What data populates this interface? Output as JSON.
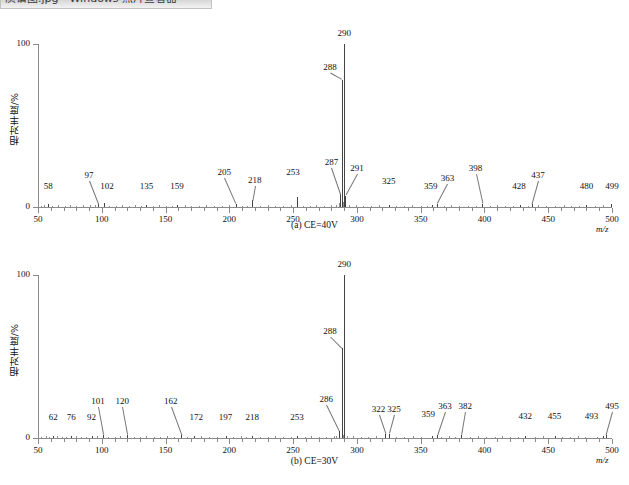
{
  "title_bar": {
    "text": "质谱图.jpg - Windows 照片查看器"
  },
  "figure": {
    "y_axis_title": "相对丰度/%",
    "x_axis_title": "m/z",
    "y_ticks": [
      0,
      100
    ],
    "y_tick_labels": [
      "0",
      "100"
    ],
    "x_range": [
      50,
      500
    ],
    "x_major_ticks": [
      50,
      100,
      150,
      200,
      250,
      300,
      350,
      400,
      450,
      500
    ],
    "x_major_labels": [
      "50",
      "100",
      "150",
      "200",
      "250",
      "300",
      "350",
      "400",
      "450",
      "500"
    ],
    "x_minor_step": 10
  },
  "captions": {
    "a": "(a) CE=40V",
    "b": "(b) CE=30V"
  },
  "chart_data": [
    {
      "type": "bar",
      "title": "(a) CE=40V",
      "xlabel": "m/z",
      "ylabel": "相对丰度/%",
      "xlim": [
        50,
        500
      ],
      "ylim": [
        0,
        100
      ],
      "grid": false,
      "legend": "none",
      "labeled_peaks": [
        {
          "mz": 58,
          "intensity": 2.0,
          "label": "58",
          "label_x": 58,
          "label_y": 9,
          "leader": false
        },
        {
          "mz": 97,
          "intensity": 2.0,
          "label": "97",
          "label_x": 90,
          "label_y": 16,
          "leader": true
        },
        {
          "mz": 102,
          "intensity": 2.5,
          "label": "102",
          "label_x": 104,
          "label_y": 9,
          "leader": false
        },
        {
          "mz": 135,
          "intensity": 1.5,
          "label": "135",
          "label_x": 135,
          "label_y": 9,
          "leader": false
        },
        {
          "mz": 159,
          "intensity": 1.5,
          "label": "159",
          "label_x": 159,
          "label_y": 9,
          "leader": false
        },
        {
          "mz": 205,
          "intensity": 2.0,
          "label": "205",
          "label_x": 196,
          "label_y": 18,
          "leader": true
        },
        {
          "mz": 218,
          "intensity": 4.0,
          "label": "218",
          "label_x": 220,
          "label_y": 13,
          "leader": true
        },
        {
          "mz": 253,
          "intensity": 6.0,
          "label": "253",
          "label_x": 250,
          "label_y": 18,
          "leader": false
        },
        {
          "mz": 287,
          "intensity": 8.0,
          "label": "287",
          "label_x": 280,
          "label_y": 24,
          "leader": true
        },
        {
          "mz": 288,
          "intensity": 78.0,
          "label": "288",
          "label_x": 279,
          "label_y": 82,
          "leader": true
        },
        {
          "mz": 290,
          "intensity": 100.0,
          "label": "290",
          "label_x": 290,
          "label_y": 103,
          "leader": false
        },
        {
          "mz": 291,
          "intensity": 7.0,
          "label": "291",
          "label_x": 300,
          "label_y": 20,
          "leader": true
        },
        {
          "mz": 325,
          "intensity": 1.5,
          "label": "325",
          "label_x": 325,
          "label_y": 12,
          "leader": false
        },
        {
          "mz": 359,
          "intensity": 1.5,
          "label": "359",
          "label_x": 358,
          "label_y": 9,
          "leader": false
        },
        {
          "mz": 363,
          "intensity": 2.0,
          "label": "363",
          "label_x": 371,
          "label_y": 14,
          "leader": true
        },
        {
          "mz": 398,
          "intensity": 2.0,
          "label": "398",
          "label_x": 393,
          "label_y": 20,
          "leader": true
        },
        {
          "mz": 428,
          "intensity": 1.5,
          "label": "428",
          "label_x": 427,
          "label_y": 9,
          "leader": false
        },
        {
          "mz": 437,
          "intensity": 2.0,
          "label": "437",
          "label_x": 442,
          "label_y": 16,
          "leader": true
        },
        {
          "mz": 480,
          "intensity": 1.5,
          "label": "480",
          "label_x": 480,
          "label_y": 9,
          "leader": false
        },
        {
          "mz": 499,
          "intensity": 2.0,
          "label": "499",
          "label_x": 500,
          "label_y": 9,
          "leader": false
        }
      ],
      "noise_peaks": [
        {
          "mz": 52,
          "intensity": 0.9
        },
        {
          "mz": 55,
          "intensity": 1.1
        },
        {
          "mz": 61,
          "intensity": 0.8
        },
        {
          "mz": 66,
          "intensity": 1.0
        },
        {
          "mz": 71,
          "intensity": 0.9
        },
        {
          "mz": 75,
          "intensity": 1.1
        },
        {
          "mz": 80,
          "intensity": 0.8
        },
        {
          "mz": 85,
          "intensity": 1.0
        },
        {
          "mz": 91,
          "intensity": 1.3
        },
        {
          "mz": 95,
          "intensity": 1.0
        },
        {
          "mz": 106,
          "intensity": 0.9
        },
        {
          "mz": 111,
          "intensity": 0.8
        },
        {
          "mz": 116,
          "intensity": 1.0
        },
        {
          "mz": 121,
          "intensity": 0.9
        },
        {
          "mz": 126,
          "intensity": 1.1
        },
        {
          "mz": 131,
          "intensity": 0.8
        },
        {
          "mz": 140,
          "intensity": 0.9
        },
        {
          "mz": 145,
          "intensity": 1.0
        },
        {
          "mz": 150,
          "intensity": 0.8
        },
        {
          "mz": 155,
          "intensity": 0.9
        },
        {
          "mz": 165,
          "intensity": 1.0
        },
        {
          "mz": 170,
          "intensity": 0.9
        },
        {
          "mz": 176,
          "intensity": 0.8
        },
        {
          "mz": 182,
          "intensity": 1.0
        },
        {
          "mz": 188,
          "intensity": 0.9
        },
        {
          "mz": 194,
          "intensity": 0.8
        },
        {
          "mz": 200,
          "intensity": 1.0
        },
        {
          "mz": 210,
          "intensity": 0.9
        },
        {
          "mz": 214,
          "intensity": 0.8
        },
        {
          "mz": 224,
          "intensity": 0.9
        },
        {
          "mz": 230,
          "intensity": 1.0
        },
        {
          "mz": 236,
          "intensity": 0.8
        },
        {
          "mz": 242,
          "intensity": 0.9
        },
        {
          "mz": 248,
          "intensity": 1.0
        },
        {
          "mz": 258,
          "intensity": 0.9
        },
        {
          "mz": 263,
          "intensity": 0.8
        },
        {
          "mz": 268,
          "intensity": 1.0
        },
        {
          "mz": 274,
          "intensity": 0.9
        },
        {
          "mz": 280,
          "intensity": 1.2
        },
        {
          "mz": 284,
          "intensity": 1.5
        },
        {
          "mz": 286,
          "intensity": 2.5
        },
        {
          "mz": 289,
          "intensity": 3.0
        },
        {
          "mz": 294,
          "intensity": 1.5
        },
        {
          "mz": 299,
          "intensity": 1.0
        },
        {
          "mz": 305,
          "intensity": 0.9
        },
        {
          "mz": 311,
          "intensity": 0.8
        },
        {
          "mz": 317,
          "intensity": 1.0
        },
        {
          "mz": 331,
          "intensity": 0.9
        },
        {
          "mz": 337,
          "intensity": 0.8
        },
        {
          "mz": 343,
          "intensity": 1.0
        },
        {
          "mz": 350,
          "intensity": 0.9
        },
        {
          "mz": 355,
          "intensity": 0.8
        },
        {
          "mz": 368,
          "intensity": 0.9
        },
        {
          "mz": 374,
          "intensity": 1.0
        },
        {
          "mz": 380,
          "intensity": 0.8
        },
        {
          "mz": 387,
          "intensity": 0.9
        },
        {
          "mz": 393,
          "intensity": 0.8
        },
        {
          "mz": 404,
          "intensity": 0.9
        },
        {
          "mz": 410,
          "intensity": 1.0
        },
        {
          "mz": 416,
          "intensity": 0.8
        },
        {
          "mz": 422,
          "intensity": 0.9
        },
        {
          "mz": 434,
          "intensity": 0.8
        },
        {
          "mz": 442,
          "intensity": 1.0
        },
        {
          "mz": 448,
          "intensity": 0.9
        },
        {
          "mz": 455,
          "intensity": 0.8
        },
        {
          "mz": 462,
          "intensity": 1.0
        },
        {
          "mz": 468,
          "intensity": 0.9
        },
        {
          "mz": 474,
          "intensity": 0.8
        },
        {
          "mz": 487,
          "intensity": 0.9
        },
        {
          "mz": 493,
          "intensity": 1.0
        }
      ]
    },
    {
      "type": "bar",
      "title": "(b) CE=30V",
      "xlabel": "m/z",
      "ylabel": "相对丰度/%",
      "xlim": [
        50,
        500
      ],
      "ylim": [
        0,
        100
      ],
      "grid": false,
      "legend": "none",
      "labeled_peaks": [
        {
          "mz": 62,
          "intensity": 1.5,
          "label": "62",
          "label_x": 62,
          "label_y": 9,
          "leader": false
        },
        {
          "mz": 76,
          "intensity": 1.5,
          "label": "76",
          "label_x": 76,
          "label_y": 9,
          "leader": false
        },
        {
          "mz": 92,
          "intensity": 1.5,
          "label": "92",
          "label_x": 92,
          "label_y": 9,
          "leader": false
        },
        {
          "mz": 101,
          "intensity": 2.0,
          "label": "101",
          "label_x": 97,
          "label_y": 19,
          "leader": true
        },
        {
          "mz": 120,
          "intensity": 2.0,
          "label": "120",
          "label_x": 116,
          "label_y": 19,
          "leader": true
        },
        {
          "mz": 162,
          "intensity": 2.0,
          "label": "162",
          "label_x": 154,
          "label_y": 19,
          "leader": true
        },
        {
          "mz": 172,
          "intensity": 1.5,
          "label": "172",
          "label_x": 174,
          "label_y": 9,
          "leader": false
        },
        {
          "mz": 197,
          "intensity": 1.5,
          "label": "197",
          "label_x": 197,
          "label_y": 9,
          "leader": false
        },
        {
          "mz": 218,
          "intensity": 1.5,
          "label": "218",
          "label_x": 218,
          "label_y": 9,
          "leader": false
        },
        {
          "mz": 253,
          "intensity": 1.5,
          "label": "253",
          "label_x": 253,
          "label_y": 9,
          "leader": false
        },
        {
          "mz": 286,
          "intensity": 4.0,
          "label": "286",
          "label_x": 276,
          "label_y": 20,
          "leader": true
        },
        {
          "mz": 288,
          "intensity": 55.0,
          "label": "288",
          "label_x": 279,
          "label_y": 62,
          "leader": true
        },
        {
          "mz": 290,
          "intensity": 100.0,
          "label": "290",
          "label_x": 290,
          "label_y": 103,
          "leader": false
        },
        {
          "mz": 322,
          "intensity": 2.5,
          "label": "322",
          "label_x": 317,
          "label_y": 14,
          "leader": true
        },
        {
          "mz": 325,
          "intensity": 2.5,
          "label": "325",
          "label_x": 329,
          "label_y": 14,
          "leader": true
        },
        {
          "mz": 359,
          "intensity": 1.5,
          "label": "359",
          "label_x": 356,
          "label_y": 11,
          "leader": false
        },
        {
          "mz": 363,
          "intensity": 2.0,
          "label": "363",
          "label_x": 369,
          "label_y": 16,
          "leader": true
        },
        {
          "mz": 382,
          "intensity": 2.0,
          "label": "382",
          "label_x": 385,
          "label_y": 16,
          "leader": true
        },
        {
          "mz": 432,
          "intensity": 1.5,
          "label": "432",
          "label_x": 432,
          "label_y": 10,
          "leader": false
        },
        {
          "mz": 455,
          "intensity": 1.5,
          "label": "455",
          "label_x": 455,
          "label_y": 10,
          "leader": false
        },
        {
          "mz": 493,
          "intensity": 1.5,
          "label": "493",
          "label_x": 484,
          "label_y": 10,
          "leader": false
        },
        {
          "mz": 495,
          "intensity": 2.0,
          "label": "495",
          "label_x": 500,
          "label_y": 16,
          "leader": true
        }
      ],
      "noise_peaks": [
        {
          "mz": 52,
          "intensity": 0.8
        },
        {
          "mz": 56,
          "intensity": 1.0
        },
        {
          "mz": 59,
          "intensity": 0.9
        },
        {
          "mz": 65,
          "intensity": 1.0
        },
        {
          "mz": 69,
          "intensity": 0.8
        },
        {
          "mz": 72,
          "intensity": 0.9
        },
        {
          "mz": 80,
          "intensity": 1.0
        },
        {
          "mz": 84,
          "intensity": 0.8
        },
        {
          "mz": 88,
          "intensity": 0.9
        },
        {
          "mz": 96,
          "intensity": 1.0
        },
        {
          "mz": 105,
          "intensity": 0.9
        },
        {
          "mz": 110,
          "intensity": 0.8
        },
        {
          "mz": 114,
          "intensity": 1.0
        },
        {
          "mz": 125,
          "intensity": 0.9
        },
        {
          "mz": 130,
          "intensity": 0.8
        },
        {
          "mz": 135,
          "intensity": 1.0
        },
        {
          "mz": 141,
          "intensity": 0.9
        },
        {
          "mz": 146,
          "intensity": 0.8
        },
        {
          "mz": 151,
          "intensity": 1.0
        },
        {
          "mz": 157,
          "intensity": 0.9
        },
        {
          "mz": 167,
          "intensity": 0.8
        },
        {
          "mz": 178,
          "intensity": 1.0
        },
        {
          "mz": 184,
          "intensity": 0.9
        },
        {
          "mz": 190,
          "intensity": 0.8
        },
        {
          "mz": 203,
          "intensity": 0.9
        },
        {
          "mz": 209,
          "intensity": 1.0
        },
        {
          "mz": 213,
          "intensity": 0.8
        },
        {
          "mz": 224,
          "intensity": 0.9
        },
        {
          "mz": 230,
          "intensity": 0.8
        },
        {
          "mz": 236,
          "intensity": 1.0
        },
        {
          "mz": 242,
          "intensity": 0.9
        },
        {
          "mz": 248,
          "intensity": 0.8
        },
        {
          "mz": 259,
          "intensity": 0.9
        },
        {
          "mz": 264,
          "intensity": 1.0
        },
        {
          "mz": 270,
          "intensity": 0.8
        },
        {
          "mz": 276,
          "intensity": 0.9
        },
        {
          "mz": 282,
          "intensity": 1.1
        },
        {
          "mz": 284,
          "intensity": 1.4
        },
        {
          "mz": 289,
          "intensity": 2.0
        },
        {
          "mz": 292,
          "intensity": 1.4
        },
        {
          "mz": 297,
          "intensity": 1.0
        },
        {
          "mz": 303,
          "intensity": 0.9
        },
        {
          "mz": 309,
          "intensity": 0.8
        },
        {
          "mz": 315,
          "intensity": 1.0
        },
        {
          "mz": 331,
          "intensity": 0.9
        },
        {
          "mz": 337,
          "intensity": 0.8
        },
        {
          "mz": 344,
          "intensity": 1.0
        },
        {
          "mz": 350,
          "intensity": 0.9
        },
        {
          "mz": 366,
          "intensity": 0.8
        },
        {
          "mz": 372,
          "intensity": 1.0
        },
        {
          "mz": 377,
          "intensity": 0.9
        },
        {
          "mz": 389,
          "intensity": 0.8
        },
        {
          "mz": 395,
          "intensity": 1.0
        },
        {
          "mz": 401,
          "intensity": 0.9
        },
        {
          "mz": 408,
          "intensity": 0.8
        },
        {
          "mz": 414,
          "intensity": 1.0
        },
        {
          "mz": 420,
          "intensity": 0.9
        },
        {
          "mz": 426,
          "intensity": 0.8
        },
        {
          "mz": 440,
          "intensity": 0.9
        },
        {
          "mz": 446,
          "intensity": 1.0
        },
        {
          "mz": 461,
          "intensity": 0.8
        },
        {
          "mz": 467,
          "intensity": 0.9
        },
        {
          "mz": 473,
          "intensity": 1.0
        },
        {
          "mz": 479,
          "intensity": 0.8
        },
        {
          "mz": 488,
          "intensity": 0.9
        }
      ]
    }
  ]
}
